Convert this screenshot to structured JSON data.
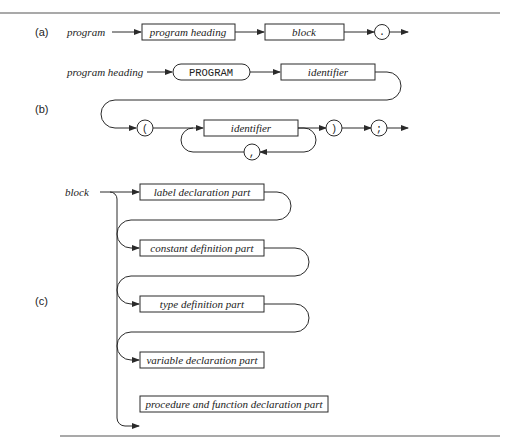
{
  "figure": {
    "part_a": {
      "label": "(a)",
      "rule_name": "program",
      "nodes": [
        "program heading",
        "block",
        "."
      ]
    },
    "part_b": {
      "label": "(b)",
      "rule_name": "program heading",
      "keyword": "PROGRAM",
      "identifier": "identifier",
      "open_paren": "(",
      "list_identifier": "identifier",
      "comma": ",",
      "close_paren": ")",
      "semicolon": ";"
    },
    "part_c": {
      "label": "(c)",
      "rule_name": "block",
      "parts": [
        "label declaration part",
        "constant definition part",
        "type definition part",
        "variable declaration part",
        "procedure and function declaration part",
        "statement part"
      ]
    }
  }
}
